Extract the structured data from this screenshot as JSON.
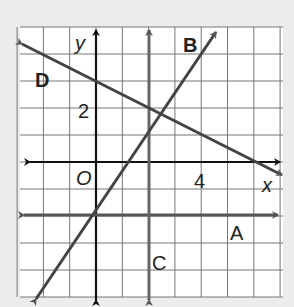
{
  "chart_data": {
    "type": "line",
    "title": "",
    "xlabel": "x",
    "ylabel": "y",
    "xlim": [
      -3,
      7
    ],
    "ylim": [
      -5,
      5
    ],
    "grid": true,
    "origin_label": "O",
    "tick_labels": {
      "x": [
        "4"
      ],
      "y": [
        "2"
      ]
    },
    "series": [
      {
        "name": "A",
        "equation": "y = -2",
        "points": [
          [
            -3,
            -2
          ],
          [
            7,
            -2
          ]
        ],
        "color": "#555555"
      },
      {
        "name": "B",
        "equation": "y = 2x - 2",
        "points": [
          [
            -2.2,
            -6.4
          ],
          [
            2.8,
            5.1
          ]
        ],
        "color": "#444444"
      },
      {
        "name": "C",
        "equation": "x = 2",
        "points": [
          [
            2,
            -5
          ],
          [
            2,
            5
          ]
        ],
        "color": "#666666"
      },
      {
        "name": "D",
        "equation": "y = -x/2 + 3",
        "points": [
          [
            -3,
            4.5
          ],
          [
            7,
            -0.5
          ]
        ],
        "color": "#444444"
      }
    ]
  },
  "labels": {
    "A": "A",
    "B": "B",
    "C": "C",
    "D": "D",
    "x_axis": "x",
    "y_axis": "y",
    "origin": "O",
    "tick_x_4": "4",
    "tick_y_2": "2"
  }
}
